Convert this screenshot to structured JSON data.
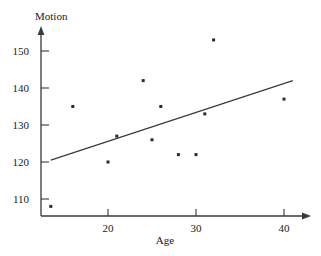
{
  "chart_data": {
    "type": "scatter",
    "title": "",
    "xlabel": "Age",
    "ylabel": "Motion",
    "xlim": [
      12,
      42
    ],
    "ylim": [
      105,
      157
    ],
    "xticks": [
      20,
      30,
      40
    ],
    "yticks": [
      110,
      120,
      130,
      140,
      150
    ],
    "xtick_labels": [
      "20",
      "30",
      "40"
    ],
    "ytick_labels": [
      "110",
      "120",
      "130",
      "140",
      "150"
    ],
    "grid": false,
    "legend": null,
    "points": [
      {
        "x": 13.5,
        "y": 108
      },
      {
        "x": 16,
        "y": 135
      },
      {
        "x": 20,
        "y": 120
      },
      {
        "x": 21,
        "y": 127
      },
      {
        "x": 24,
        "y": 142
      },
      {
        "x": 25,
        "y": 126
      },
      {
        "x": 26,
        "y": 135
      },
      {
        "x": 28,
        "y": 122
      },
      {
        "x": 30,
        "y": 122
      },
      {
        "x": 31,
        "y": 133
      },
      {
        "x": 32,
        "y": 153
      },
      {
        "x": 40,
        "y": 137
      }
    ],
    "trend_line": {
      "x1": 13.5,
      "y1": 120.5,
      "x2": 41,
      "y2": 142
    },
    "marker_color": "#2b2b2b",
    "line_color": "#3a3a3a",
    "axis_color": "#3a3a3a",
    "background_color": "#ffffff"
  }
}
